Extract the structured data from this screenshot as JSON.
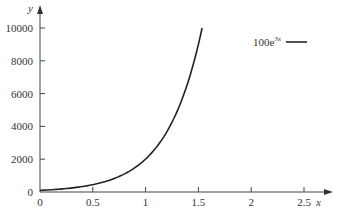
{
  "chart_data": {
    "type": "line",
    "title": "",
    "xlabel": "x",
    "ylabel": "y",
    "xlim": [
      0,
      2.6
    ],
    "ylim": [
      0,
      10400
    ],
    "x_ticks": [
      "0",
      "0.5",
      "1",
      "1.5",
      "2",
      "2.5"
    ],
    "y_ticks": [
      "0",
      "2000",
      "4000",
      "6000",
      "8000",
      "10000"
    ],
    "grid": false,
    "legend_position": "upper right",
    "series": [
      {
        "name": "100e^{3x}",
        "legend_base": "100e",
        "legend_exp": "3x",
        "color": "#222222",
        "x": [
          0,
          0.25,
          0.5,
          0.75,
          1.0,
          1.1,
          1.2,
          1.3,
          1.4,
          1.5,
          1.535
        ],
        "values": [
          100,
          212,
          448,
          949,
          2009,
          2711,
          3660,
          4940,
          6669,
          9002,
          10000
        ]
      }
    ]
  }
}
